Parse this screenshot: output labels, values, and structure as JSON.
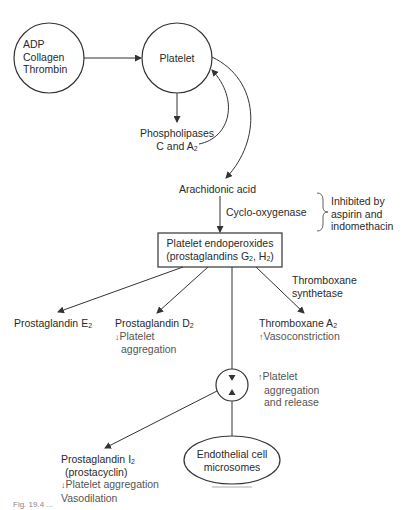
{
  "diagram": {
    "nodes": {
      "stimuli": {
        "lines": [
          "ADP",
          "Collagen",
          "Thrombin"
        ]
      },
      "platelet": {
        "label": "Platelet"
      },
      "phospholipases": {
        "line1": "Phospholipases",
        "line2_prefix": "C and A",
        "line2_sub": "2"
      },
      "arachidonic_acid": {
        "label": "Arachidonic acid"
      },
      "cyclo_oxygenase": {
        "label": "Cyclo-oxygenase"
      },
      "inhibition_note": {
        "lines": [
          "Inhibited by",
          "aspirin and",
          "indomethacin"
        ]
      },
      "endoperoxides": {
        "line1": "Platelet endoperoxides",
        "line2_prefix": "(prostaglandins G",
        "line2_sub1": "2",
        "line2_mid": ", H",
        "line2_sub2": "2",
        "line2_suffix": ")"
      },
      "thromboxane_synthetase": {
        "lines": [
          "Thromboxane",
          "synthetase"
        ]
      },
      "prostaglandin_e2": {
        "prefix": "Prostaglandin E",
        "sub": "2"
      },
      "prostaglandin_d2": {
        "prefix": "Prostaglandin D",
        "sub": "2",
        "effect_arrow": "↓",
        "effect_lines": [
          "Platelet",
          "aggregation"
        ]
      },
      "thromboxane_a2": {
        "prefix": "Thromboxane A",
        "sub": "2",
        "effect_arrow": "↑",
        "effect": "Vasoconstriction"
      },
      "platelet_aggregation_release": {
        "effect_arrow": "↑",
        "lines": [
          "Platelet",
          "aggregation",
          "and release"
        ]
      },
      "prostaglandin_i2": {
        "prefix": "Prostaglandin I",
        "sub": "2",
        "alias": "(prostacyclin)",
        "effect_arrow": "↓",
        "effect1": "Platelet aggregation",
        "effect2": "Vasodilation"
      },
      "endothelial": {
        "lines": [
          "Endothelial cell",
          "microsomes"
        ]
      }
    },
    "caption": "Fig. 19.4 ..."
  },
  "colors": {
    "line": "#333333",
    "text": "#2a2a2a",
    "effect_text": "#555555"
  }
}
